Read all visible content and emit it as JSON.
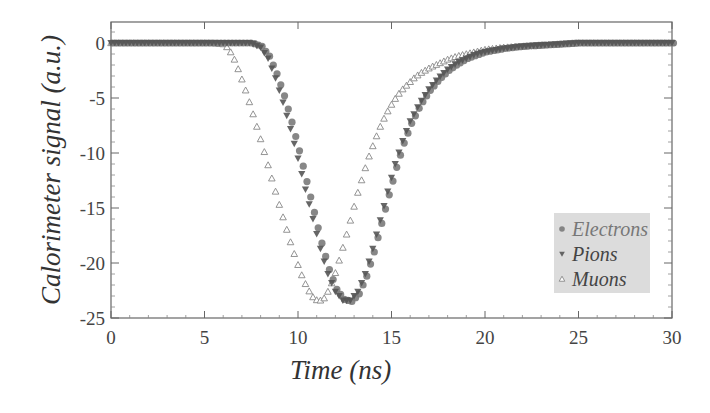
{
  "chart_data": {
    "type": "scatter",
    "title": "",
    "xlabel": "Time (ns)",
    "ylabel": "Calorimeter signal (a.u.)",
    "xlim": [
      0,
      30
    ],
    "ylim": [
      -25,
      2
    ],
    "xticks": [
      0,
      5,
      10,
      15,
      20,
      25,
      30
    ],
    "yticks": [
      0,
      -5,
      -10,
      -15,
      -20,
      -25
    ],
    "grid": false,
    "legend_position": "lower right",
    "series": [
      {
        "name": "Electrons",
        "marker": "circle",
        "color": "#7a7a7a",
        "x": [
          0,
          0.5,
          1,
          1.5,
          2,
          2.5,
          3,
          3.5,
          4,
          4.5,
          5,
          5.5,
          6,
          6.5,
          7,
          7.5,
          8,
          8.4,
          8.8,
          9.2,
          9.6,
          10.0,
          10.4,
          10.8,
          11.2,
          11.6,
          12.0,
          12.4,
          12.8,
          13.2,
          13.6,
          14.0,
          14.4,
          14.8,
          15.2,
          15.6,
          16.0,
          16.5,
          17,
          17.5,
          18,
          18.5,
          19,
          19.5,
          20,
          21,
          22,
          23,
          24,
          25,
          26,
          27,
          28,
          29,
          30
        ],
        "y": [
          0,
          0,
          0,
          0,
          0,
          0,
          0,
          0,
          0,
          0,
          0,
          0,
          0,
          0,
          0,
          0,
          -0.3,
          -1.2,
          -2.8,
          -4.8,
          -7.2,
          -9.8,
          -12.6,
          -15.4,
          -18.2,
          -20.6,
          -22.4,
          -23.3,
          -23.5,
          -22.8,
          -21.2,
          -19.0,
          -16.4,
          -13.8,
          -11.3,
          -9.1,
          -7.3,
          -5.6,
          -4.3,
          -3.3,
          -2.5,
          -1.9,
          -1.4,
          -1.1,
          -0.8,
          -0.5,
          -0.3,
          -0.2,
          -0.1,
          0,
          0,
          0,
          0,
          0,
          0
        ]
      },
      {
        "name": "Pions",
        "marker": "triangle-down",
        "color": "#555555",
        "x": [
          0,
          0.5,
          1,
          1.5,
          2,
          2.5,
          3,
          3.5,
          4,
          4.5,
          5,
          5.5,
          6,
          6.5,
          7,
          7.5,
          8,
          8.4,
          8.8,
          9.2,
          9.6,
          10.0,
          10.4,
          10.8,
          11.2,
          11.6,
          12.0,
          12.4,
          12.8,
          13.2,
          13.6,
          14.0,
          14.4,
          14.8,
          15.2,
          15.6,
          16.0,
          16.5,
          17,
          17.5,
          18,
          18.5,
          19,
          19.5,
          20,
          21,
          22,
          23,
          24,
          25,
          26,
          27,
          28,
          29,
          30
        ],
        "y": [
          0,
          0,
          0,
          0,
          0,
          0,
          0,
          0,
          0,
          0,
          0,
          0,
          0,
          0,
          0,
          0,
          -0.4,
          -1.4,
          -3.2,
          -5.4,
          -7.8,
          -10.5,
          -13.3,
          -16.0,
          -18.7,
          -21.0,
          -22.6,
          -23.4,
          -23.4,
          -22.6,
          -21.0,
          -18.7,
          -16.1,
          -13.5,
          -11.0,
          -8.9,
          -7.1,
          -5.5,
          -4.2,
          -3.2,
          -2.4,
          -1.8,
          -1.4,
          -1.0,
          -0.8,
          -0.5,
          -0.3,
          -0.2,
          -0.1,
          0,
          0,
          0,
          0,
          0,
          0
        ]
      },
      {
        "name": "Muons",
        "marker": "triangle-up-open",
        "color": "#888888",
        "x": [
          0,
          0.5,
          1,
          1.5,
          2,
          2.5,
          3,
          3.5,
          4,
          4.5,
          5,
          5.5,
          6,
          6.3,
          6.6,
          6.9,
          7.2,
          7.5,
          7.8,
          8.1,
          8.4,
          8.7,
          9.0,
          9.3,
          9.6,
          9.9,
          10.2,
          10.5,
          10.8,
          11.1,
          11.4,
          11.7,
          12.0,
          12.3,
          12.6,
          12.9,
          13.2,
          13.5,
          13.8,
          14.1,
          14.4,
          14.7,
          15.0,
          15.3,
          15.6,
          15.9,
          16.2,
          16.5,
          16.8,
          17.1,
          17.5,
          18,
          18.5,
          19,
          19.5,
          20,
          21,
          22,
          23,
          24,
          25,
          26,
          27,
          28,
          29,
          30
        ],
        "y": [
          0,
          0,
          0,
          0,
          0,
          0,
          0,
          0,
          0,
          0,
          0,
          0,
          -0.1,
          -0.5,
          -1.5,
          -2.8,
          -4.3,
          -5.9,
          -7.6,
          -9.3,
          -11.1,
          -12.9,
          -14.7,
          -16.4,
          -18.1,
          -19.7,
          -21.1,
          -22.3,
          -23.1,
          -23.5,
          -23.2,
          -22.3,
          -20.9,
          -19.2,
          -17.4,
          -15.5,
          -13.6,
          -11.9,
          -10.3,
          -8.9,
          -7.6,
          -6.5,
          -5.6,
          -4.8,
          -4.2,
          -3.7,
          -3.2,
          -2.8,
          -2.5,
          -2.2,
          -1.9,
          -1.5,
          -1.2,
          -1.0,
          -0.8,
          -0.6,
          -0.4,
          -0.3,
          -0.2,
          -0.1,
          0,
          0,
          0,
          0,
          0,
          0
        ]
      }
    ],
    "legend": {
      "entries": [
        "Electrons",
        "Pions",
        "Muons"
      ],
      "background": "#dcdcdc"
    }
  },
  "axes": {
    "xlabel": "Time (ns)",
    "ylabel": "Calorimeter signal (a.u.)"
  }
}
